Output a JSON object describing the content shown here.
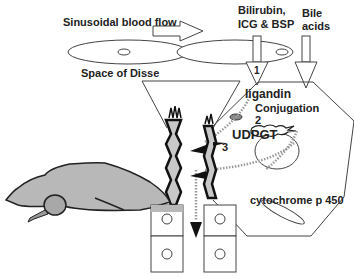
{
  "diagram": {
    "labels": {
      "sinusoidal_blood_flow": "Sinusoidal blood flow",
      "bilirubin_line1": "Bilirubin,",
      "bilirubin_line2": "ICG & BSP",
      "bile_line1": "Bile",
      "bile_line2": "acids",
      "space_of_disse": "Space of Disse",
      "ligandin": "ligandin",
      "conjugation": "Conjugation",
      "step1": "1",
      "step2": "2",
      "step3": "3",
      "udpgt": "UDPGT",
      "cytochrome": "cytochrome p 450"
    },
    "colors": {
      "line": "#333333",
      "organ_fill": "#b8b8b8",
      "canal_fill": "#c8c8c8",
      "dark": "#111111"
    },
    "icons": [
      "flow-arrow-icon",
      "uptake-arrow-icon",
      "gallbladder-icon",
      "excretion-arrow-icon"
    ]
  }
}
